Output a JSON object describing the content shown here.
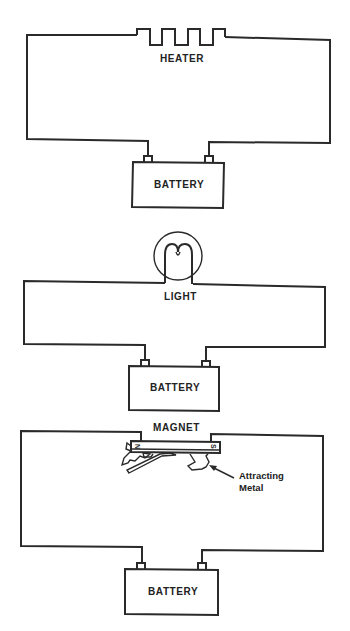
{
  "diagram": {
    "circuits": [
      {
        "id": "heater-circuit",
        "load_label": "HEATER",
        "source_label": "BATTERY"
      },
      {
        "id": "light-circuit",
        "load_label": "LIGHT",
        "source_label": "BATTERY"
      },
      {
        "id": "magnet-circuit",
        "load_label": "MAGNET",
        "source_label": "BATTERY",
        "pole_left": "N",
        "pole_right": "S",
        "annotation_line1": "Attracting",
        "annotation_line2": "Metal"
      }
    ],
    "colors": {
      "line": "#2a2a2a",
      "background": "#ffffff"
    }
  }
}
